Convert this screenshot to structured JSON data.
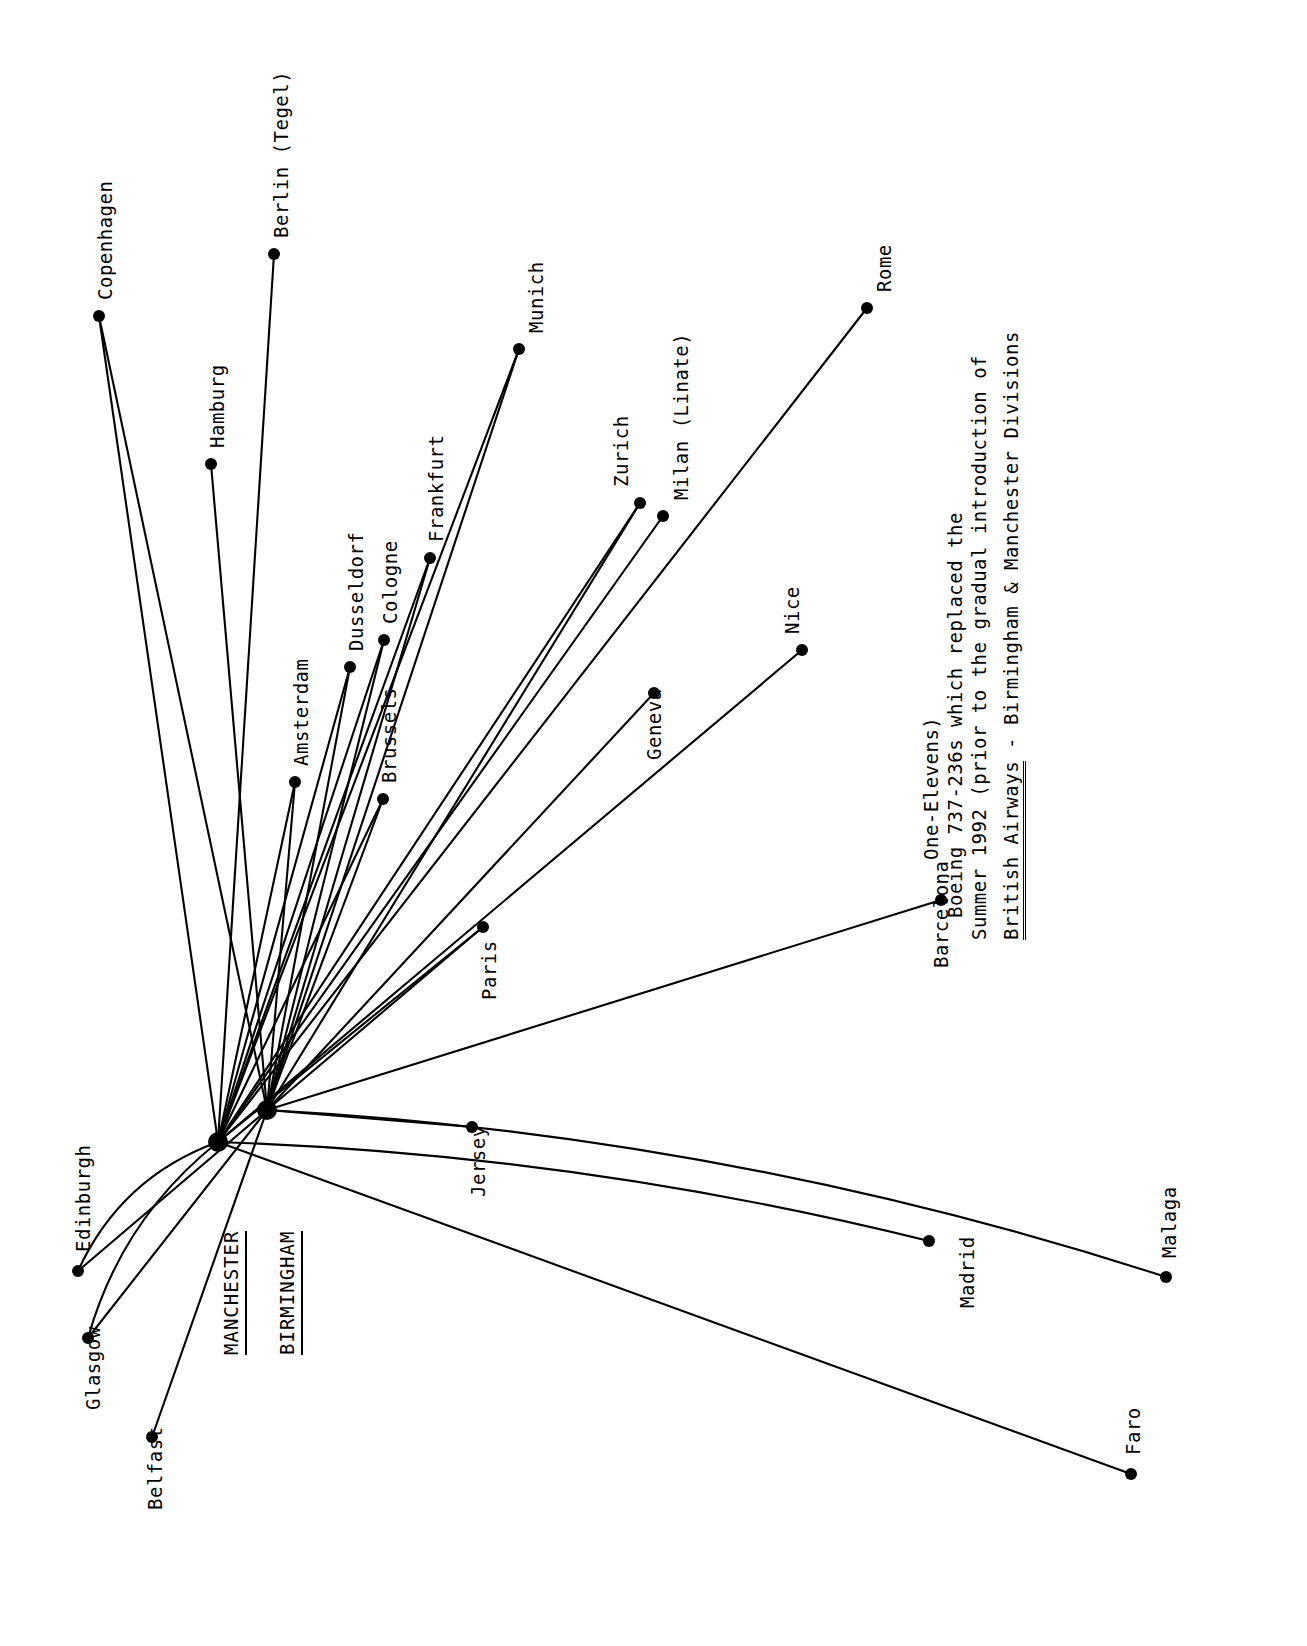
{
  "document": {
    "kind": "airline-route-map",
    "orientation": "labels-rotated-90-ccw",
    "background_color": "#ffffff",
    "ink_color": "#000000"
  },
  "caption": {
    "title_underlined": "British Airways",
    "title_rest": " - Birmingham & Manchester Divisions",
    "line2": "Summer 1992 (prior to the gradual introduction of",
    "line3": "Boeing 737-236s which replaced the",
    "line4": "One-Elevens)"
  },
  "hubs": [
    {
      "id": "MAN",
      "label": "MANCHESTER",
      "x": 218,
      "y": 1142,
      "label_x": 222,
      "label_y": 1355
    },
    {
      "id": "BHX",
      "label": "BIRMINGHAM",
      "x": 267,
      "y": 1110,
      "label_x": 278,
      "label_y": 1355
    }
  ],
  "destinations": [
    {
      "id": "copenhagen",
      "label": "Copenhagen",
      "x": 99,
      "y": 316,
      "label_x": 96,
      "label_y": 300
    },
    {
      "id": "berlin",
      "label": "Berlin (Tegel)",
      "x": 274,
      "y": 254,
      "label_x": 272,
      "label_y": 238
    },
    {
      "id": "hamburg",
      "label": "Hamburg",
      "x": 211,
      "y": 464,
      "label_x": 208,
      "label_y": 448
    },
    {
      "id": "munich",
      "label": "Munich",
      "x": 519,
      "y": 349,
      "label_x": 527,
      "label_y": 333
    },
    {
      "id": "amsterdam",
      "label": "Amsterdam",
      "x": 295,
      "y": 782,
      "label_x": 292,
      "label_y": 766
    },
    {
      "id": "dusseldorf",
      "label": "Dusseldorf",
      "x": 350,
      "y": 667,
      "label_x": 347,
      "label_y": 651
    },
    {
      "id": "cologne",
      "label": "Cologne",
      "x": 384,
      "y": 640,
      "label_x": 381,
      "label_y": 624
    },
    {
      "id": "frankfurt",
      "label": "Frankfurt",
      "x": 430,
      "y": 558,
      "label_x": 427,
      "label_y": 542
    },
    {
      "id": "brussels",
      "label": "Brussels",
      "x": 383,
      "y": 799,
      "label_x": 380,
      "label_y": 783
    },
    {
      "id": "paris",
      "label": "Paris",
      "x": 483,
      "y": 927,
      "label_x": 480,
      "label_y": 1000
    },
    {
      "id": "zurich",
      "label": "Zurich",
      "x": 640,
      "y": 503,
      "label_x": 612,
      "label_y": 487
    },
    {
      "id": "milan",
      "label": "Milan (Linate)",
      "x": 663,
      "y": 516,
      "label_x": 672,
      "label_y": 500
    },
    {
      "id": "geneva",
      "label": "Geneva",
      "x": 654,
      "y": 693,
      "label_x": 645,
      "label_y": 760
    },
    {
      "id": "nice",
      "label": "Nice",
      "x": 802,
      "y": 650,
      "label_x": 783,
      "label_y": 634
    },
    {
      "id": "rome",
      "label": "Rome",
      "x": 867,
      "y": 308,
      "label_x": 875,
      "label_y": 292
    },
    {
      "id": "barcelona",
      "label": "Barcelona",
      "x": 941,
      "y": 900,
      "label_x": 932,
      "label_y": 968
    },
    {
      "id": "madrid",
      "label": "Madrid",
      "x": 929,
      "y": 1241,
      "label_x": 958,
      "label_y": 1308
    },
    {
      "id": "malaga",
      "label": "Malaga",
      "x": 1166,
      "y": 1277,
      "label_x": 1160,
      "label_y": 1258
    },
    {
      "id": "faro",
      "label": "Faro",
      "x": 1131,
      "y": 1474,
      "label_x": 1124,
      "label_y": 1455
    },
    {
      "id": "jersey",
      "label": "Jersey",
      "x": 472,
      "y": 1127,
      "label_x": 469,
      "label_y": 1197
    },
    {
      "id": "edinburgh",
      "label": "Edinburgh",
      "x": 78,
      "y": 1271,
      "label_x": 74,
      "label_y": 1252
    },
    {
      "id": "glasgow",
      "label": "Glasgow",
      "x": 88,
      "y": 1338,
      "label_x": 84,
      "label_y": 1410
    },
    {
      "id": "belfast",
      "label": "Belfast",
      "x": 152,
      "y": 1437,
      "label_x": 146,
      "label_y": 1510
    }
  ],
  "routes": [
    {
      "from": "MAN",
      "to": "copenhagen",
      "curve": 0
    },
    {
      "from": "BHX",
      "to": "copenhagen",
      "curve": 0
    },
    {
      "from": "MAN",
      "to": "berlin",
      "curve": 0
    },
    {
      "from": "BHX",
      "to": "hamburg",
      "curve": 0
    },
    {
      "from": "MAN",
      "to": "munich",
      "curve": 0
    },
    {
      "from": "BHX",
      "to": "munich",
      "curve": 0
    },
    {
      "from": "MAN",
      "to": "amsterdam",
      "curve": 0
    },
    {
      "from": "BHX",
      "to": "amsterdam",
      "curve": 0
    },
    {
      "from": "MAN",
      "to": "dusseldorf",
      "curve": 0
    },
    {
      "from": "BHX",
      "to": "dusseldorf",
      "curve": 0
    },
    {
      "from": "MAN",
      "to": "cologne",
      "curve": 0
    },
    {
      "from": "BHX",
      "to": "cologne",
      "curve": 0
    },
    {
      "from": "MAN",
      "to": "frankfurt",
      "curve": 0
    },
    {
      "from": "BHX",
      "to": "frankfurt",
      "curve": 0
    },
    {
      "from": "MAN",
      "to": "brussels",
      "curve": 0
    },
    {
      "from": "BHX",
      "to": "brussels",
      "curve": 0
    },
    {
      "from": "MAN",
      "to": "paris",
      "curve": 0
    },
    {
      "from": "BHX",
      "to": "paris",
      "curve": 0
    },
    {
      "from": "MAN",
      "to": "zurich",
      "curve": 0
    },
    {
      "from": "BHX",
      "to": "zurich",
      "curve": 0
    },
    {
      "from": "MAN",
      "to": "milan",
      "curve": 0
    },
    {
      "from": "BHX",
      "to": "geneva",
      "curve": 0
    },
    {
      "from": "MAN",
      "to": "nice",
      "curve": 0
    },
    {
      "from": "MAN",
      "to": "rome",
      "curve": 0
    },
    {
      "from": "BHX",
      "to": "barcelona",
      "curve": 0
    },
    {
      "from": "MAN",
      "to": "madrid",
      "curve": -38
    },
    {
      "from": "BHX",
      "to": "malaga",
      "curve": -60
    },
    {
      "from": "MAN",
      "to": "faro",
      "curve": 0
    },
    {
      "from": "BHX",
      "to": "jersey",
      "curve": 0
    },
    {
      "from": "MAN",
      "to": "edinburgh",
      "curve": 40
    },
    {
      "from": "BHX",
      "to": "edinburgh",
      "curve": 0
    },
    {
      "from": "MAN",
      "to": "glasgow",
      "curve": 38
    },
    {
      "from": "BHX",
      "to": "glasgow",
      "curve": 0
    },
    {
      "from": "BHX",
      "to": "belfast",
      "curve": 0
    }
  ]
}
